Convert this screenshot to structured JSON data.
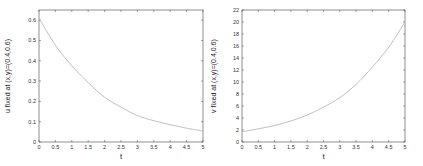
{
  "chart_data": [
    {
      "type": "line",
      "title": "",
      "xlabel": "t",
      "ylabel": "u fixed at (x,y)=(0.4,0.6)",
      "xlim": [
        0,
        5
      ],
      "ylim": [
        0,
        0.65
      ],
      "xticks": [
        "0",
        "0.5",
        "1",
        "1.5",
        "2",
        "2.5",
        "3",
        "3.5",
        "4",
        "4.5",
        "5"
      ],
      "yticks": [
        "0",
        "0.1",
        "0.2",
        "0.3",
        "0.4",
        "0.5",
        "0.6"
      ],
      "grid": false,
      "line_color": "#b8b8b8",
      "series": [
        {
          "name": "u",
          "x": [
            0,
            0.5,
            1,
            1.5,
            2,
            2.5,
            3,
            3.5,
            4,
            4.5,
            5
          ],
          "values": [
            0.61,
            0.477,
            0.375,
            0.293,
            0.22,
            0.172,
            0.13,
            0.105,
            0.085,
            0.068,
            0.054
          ]
        }
      ]
    },
    {
      "type": "line",
      "title": "",
      "xlabel": "t",
      "ylabel": "v fixed at (x,y)=(0.4,0.6)",
      "xlim": [
        0,
        5
      ],
      "ylim": [
        0,
        22
      ],
      "xticks": [
        "0",
        "0.5",
        "1",
        "1.5",
        "2",
        "2.5",
        "3",
        "3.5",
        "4",
        "4.5",
        "5"
      ],
      "yticks": [
        "0",
        "2",
        "4",
        "6",
        "8",
        "10",
        "12",
        "14",
        "16",
        "18",
        "20",
        "22"
      ],
      "grid": false,
      "line_color": "#b8b8b8",
      "series": [
        {
          "name": "v",
          "x": [
            0,
            0.5,
            1,
            1.5,
            2,
            2.5,
            3,
            3.5,
            4,
            4.5,
            5
          ],
          "values": [
            1.7,
            2.2,
            2.75,
            3.5,
            4.5,
            5.8,
            7.4,
            9.6,
            12.5,
            15.8,
            20.0
          ]
        }
      ]
    }
  ]
}
